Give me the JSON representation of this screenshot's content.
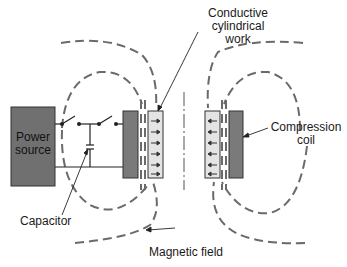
{
  "diagram": {
    "labels": {
      "power_source_line1": "Power",
      "power_source_line2": "source",
      "work_line1": "Conductive",
      "work_line2": "cylindrical",
      "work_line3": "work",
      "coil_line1": "Compression",
      "coil_line2": "coil",
      "capacitor": "Capacitor",
      "magnetic_field": "Magnetic field"
    },
    "components": [
      "Power source",
      "Switch",
      "Switch",
      "Capacitor",
      "Compression coil",
      "Conductive cylindrical work",
      "Magnetic field lines",
      "Centerline"
    ],
    "colors": {
      "power_source_fill": "#707070",
      "coil_fill": "#7a7a7a",
      "work_fill": "#e4e4e4",
      "field_line": "#6a6a6a",
      "wire": "#222222"
    }
  }
}
